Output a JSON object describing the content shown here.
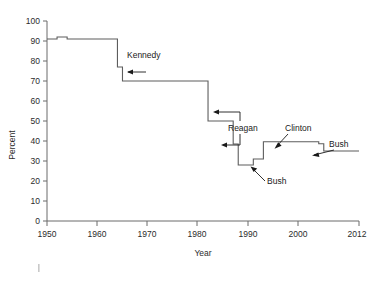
{
  "chart_data": {
    "type": "line",
    "title": "",
    "xlabel": "Year",
    "ylabel": "Percent",
    "xlim": [
      1950,
      2012
    ],
    "ylim": [
      0,
      100
    ],
    "grid": false,
    "legend": "none",
    "x_ticks": [
      1950,
      1960,
      1970,
      1980,
      1990,
      2000,
      2012
    ],
    "y_ticks": [
      0,
      10,
      20,
      30,
      40,
      50,
      60,
      70,
      80,
      90,
      100
    ],
    "series": [
      {
        "name": "Top marginal tax rate",
        "x": [
          1950,
          1951,
          1952,
          1953,
          1954,
          1955,
          1963,
          1964,
          1965,
          1981,
          1982,
          1986,
          1987,
          1988,
          1990,
          1991,
          1992,
          1993,
          1994,
          2002,
          2003,
          2004,
          2005,
          2012
        ],
        "values": [
          91,
          91,
          92,
          92,
          91,
          91,
          91,
          77,
          70,
          70,
          50,
          50,
          38.5,
          28,
          28,
          31,
          31,
          39.6,
          39.6,
          39.6,
          39.6,
          38.6,
          35,
          35
        ]
      }
    ],
    "annotations": [
      {
        "label": "Kennedy",
        "arrows": 1,
        "points_to_year": 1964,
        "points_to_value": 77
      },
      {
        "label": "Reagan",
        "arrows": 2,
        "points_to_year": 1982,
        "points_to_value": 50
      },
      {
        "label": "Bush",
        "arrows": 1,
        "points_to_year": 1991,
        "points_to_value": 31
      },
      {
        "label": "Clinton",
        "arrows": 1,
        "points_to_year": 1993,
        "points_to_value": 39.6
      },
      {
        "label": "Bush",
        "arrows": 1,
        "points_to_year": 2004,
        "points_to_value": 37
      }
    ]
  },
  "axes": {
    "y_title": "Percent",
    "x_title": "Year",
    "y_tick_labels": [
      "100",
      "90",
      "80",
      "70",
      "60",
      "50",
      "40",
      "30",
      "20",
      "10",
      "0"
    ],
    "x_tick_labels": [
      "1950",
      "1960",
      "1970",
      "1980",
      "1990",
      "2000",
      "2012"
    ]
  },
  "annotation_labels": {
    "kennedy": "Kennedy",
    "reagan": "Reagan",
    "bush_early": "Bush",
    "clinton": "Clinton",
    "bush_late": "Bush"
  }
}
